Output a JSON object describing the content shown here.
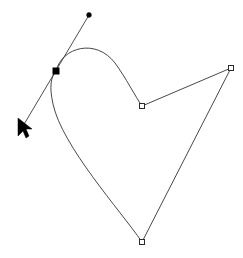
{
  "canvas": {
    "width": 243,
    "height": 258,
    "background_color": "#ffffff",
    "title": "Path Node Editor Canvas"
  },
  "style": {
    "path_stroke_color": "#333333",
    "handle_line_color": "#3a3a3a",
    "node_fill_selected": "#000000",
    "node_fill_unselected": "#ffffff",
    "node_stroke_color": "#2a2a2a",
    "cursor_color": "#000000"
  },
  "shape": {
    "name": "heart-path",
    "closed": true,
    "path_d": "M 56 71 C 62 47 96 38 115 63 C 126 78 135 96 142 106 L 231 68 L 142 242 C 120 210 62 146 53 104 C 49 86 51 77 56 71 Z",
    "segments": [
      {
        "id": "seg-curve-top-right",
        "type": "cubic-bezier",
        "from_node": "node-anchor-selected",
        "to_node": "node-anchor-mid"
      },
      {
        "id": "seg-line-mid-right",
        "type": "line",
        "from_node": "node-anchor-mid",
        "to_node": "node-anchor-right"
      },
      {
        "id": "seg-line-right-bottom",
        "type": "line",
        "from_node": "node-anchor-right",
        "to_node": "node-anchor-bottom"
      },
      {
        "id": "seg-curve-bottom-left",
        "type": "cubic-bezier",
        "from_node": "node-anchor-bottom",
        "to_node": "node-anchor-selected"
      }
    ]
  },
  "nodes": [
    {
      "id": "node-anchor-selected",
      "label": "selected-anchor-node",
      "x": 56,
      "y": 71,
      "selected": true,
      "node_type": "cusp",
      "size": 6
    },
    {
      "id": "node-anchor-mid",
      "label": "mid-anchor-node",
      "x": 142,
      "y": 106,
      "selected": false,
      "node_type": "cusp",
      "size": 5
    },
    {
      "id": "node-anchor-right",
      "label": "right-anchor-node",
      "x": 231,
      "y": 68,
      "selected": false,
      "node_type": "cusp",
      "size": 5
    },
    {
      "id": "node-anchor-bottom",
      "label": "bottom-anchor-node",
      "x": 142,
      "y": 242,
      "selected": false,
      "node_type": "cusp",
      "size": 5
    }
  ],
  "handles": [
    {
      "id": "handle-line-selected",
      "label": "control-handle-line",
      "x1": 89,
      "y1": 15,
      "x2": 23,
      "y2": 126,
      "control_dot": {
        "id": "handle-dot-top",
        "label": "control-handle-endpoint",
        "x": 89,
        "y": 15,
        "radius": 2.4
      }
    }
  ],
  "cursor": {
    "id": "mouse-cursor",
    "label": "arrow-pointer",
    "x": 18,
    "y": 118,
    "points": "18,118 18,136 23,131 26,138 29,136 26,129 32,129",
    "rotation_deg": 0
  }
}
